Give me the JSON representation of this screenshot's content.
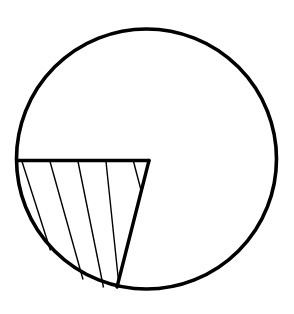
{
  "figure": {
    "background_color": "#ffffff",
    "stroke_color": "#000000",
    "canvas": {
      "width": 294,
      "height": 314
    }
  },
  "chart_data": {
    "type": "diagram",
    "xlabel": "",
    "ylabel": "",
    "xlim": [
      0,
      294
    ],
    "ylim": [
      0,
      314
    ],
    "grid": false,
    "legend": "none",
    "shapes": [
      {
        "name": "circle-outline",
        "kind": "circle",
        "cx": 146.5,
        "cy": 159.0,
        "r": 130.0,
        "stroke": "#000000",
        "stroke_width": 3.6,
        "fill": "none"
      },
      {
        "name": "horizontal-chord",
        "kind": "line",
        "x1": 17.0,
        "y1": 160.5,
        "x2": 149.0,
        "y2": 160.5,
        "stroke": "#000000",
        "stroke_width": 3.4
      },
      {
        "name": "diagonal-edge",
        "kind": "line",
        "x1": 149.0,
        "y1": 160.5,
        "x2": 117.0,
        "y2": 287.0,
        "stroke": "#000000",
        "stroke_width": 3.4
      }
    ],
    "hatching": {
      "name": "segment-hatching",
      "count": 5,
      "stroke": "#000000",
      "stroke_width": 1.4,
      "orientation": "parallel-to-diagonal-edge",
      "lines": [
        {
          "x1": 22.0,
          "y1": 161.5,
          "x2": 50.5,
          "y2": 250.5
        },
        {
          "x1": 50.0,
          "y1": 161.5,
          "x2": 83.0,
          "y2": 279.5
        },
        {
          "x1": 78.0,
          "y1": 161.5,
          "x2": 103.5,
          "y2": 287.5
        },
        {
          "x1": 106.0,
          "y1": 161.5,
          "x2": 118.5,
          "y2": 281.0
        },
        {
          "x1": 133.5,
          "y1": 161.5,
          "x2": 141.0,
          "y2": 190.0
        }
      ]
    }
  }
}
